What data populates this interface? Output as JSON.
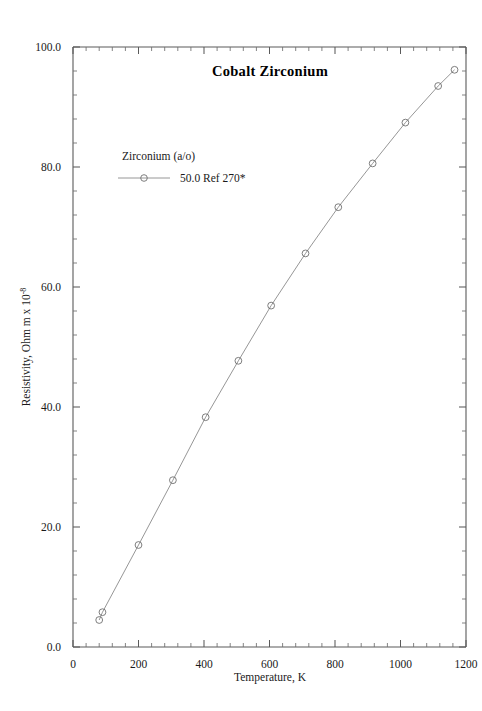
{
  "figure": {
    "page_mark": "",
    "title": "Cobalt  Zirconium",
    "legend": {
      "header": "Zirconium (a/o)",
      "entries": [
        {
          "label": "50.0 Ref 270*",
          "marker": "open-circle",
          "color": "#6f6f6f"
        }
      ]
    },
    "axes": {
      "x_label": "Temperature,  K",
      "y_label_main": "Resistivity, Ohm m x 10",
      "y_label_exponent": "-8",
      "x_ticks": [
        "0",
        "200",
        "400",
        "600",
        "800",
        "1000",
        "1200"
      ],
      "y_ticks": [
        "0.0",
        "20.0",
        "40.0",
        "60.0",
        "80.0",
        "100.0"
      ]
    }
  },
  "chart_data": {
    "type": "line",
    "title": "Cobalt  Zirconium",
    "xlabel": "Temperature,  K",
    "ylabel": "Resistivity, Ohm m x 10^-8",
    "xlim": [
      0,
      1200
    ],
    "ylim": [
      0.0,
      100.0
    ],
    "x_tick_values": [
      0,
      200,
      400,
      600,
      800,
      1000,
      1200
    ],
    "y_tick_values": [
      0.0,
      20.0,
      40.0,
      60.0,
      80.0,
      100.0
    ],
    "x_minor_per_major": 4,
    "y_minor_per_major": 4,
    "grid": false,
    "legend_position": "upper-left-inside",
    "series": [
      {
        "name": "50.0 Ref 270*",
        "marker": "open-circle",
        "color": "#6f6f6f",
        "x": [
          80,
          90,
          200,
          305,
          405,
          505,
          605,
          710,
          810,
          915,
          1015,
          1115,
          1165
        ],
        "y": [
          4.5,
          5.8,
          17.0,
          27.8,
          38.3,
          47.7,
          56.9,
          65.6,
          73.3,
          80.6,
          87.4,
          93.5,
          96.2
        ]
      }
    ]
  }
}
